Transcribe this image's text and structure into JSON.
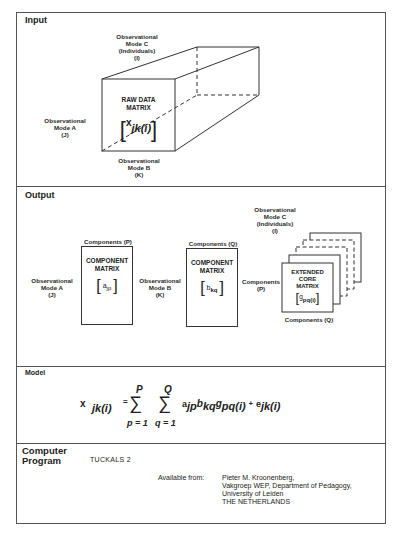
{
  "sections": {
    "input": {
      "title": "Input",
      "mode_c": [
        "Observational",
        "Mode C",
        "(Individuals)",
        "(I)"
      ],
      "mode_a": [
        "Observational",
        "Mode A",
        "(J)"
      ],
      "mode_b": [
        "Observational",
        "Mode B",
        "(K)"
      ],
      "box_title": [
        "RAW DATA",
        "MATRIX"
      ],
      "matrix_symbol": "x",
      "matrix_subscript": "jk(i)"
    },
    "output": {
      "title": "Output",
      "mode_a": [
        "Observational",
        "Mode A",
        "(J)"
      ],
      "mode_b": [
        "Observational",
        "Mode B",
        "(K)"
      ],
      "mode_c": [
        "Observational",
        "Mode C",
        "(Individuals)",
        "(I)"
      ],
      "comp_a": {
        "top_label": "Components (P)",
        "title": [
          "COMPONENT",
          "MATRIX"
        ],
        "symbol": "a",
        "subscript": "jp"
      },
      "comp_b": {
        "top_label": "Components (Q)",
        "title": [
          "COMPONENT",
          "MATRIX"
        ],
        "symbol": "b",
        "subscript": "kq"
      },
      "core": {
        "left_label": [
          "Components",
          "(P)"
        ],
        "bottom_label": "Components (Q)",
        "title": [
          "EXTENDED",
          "CORE",
          "MATRIX"
        ],
        "symbol": "g",
        "subscript": "pq(i)"
      }
    },
    "model": {
      "title": "Model",
      "lhs": "x",
      "lhs_sub": "jk(i)",
      "equals": "=",
      "sum1_top": "P",
      "sum1_bottom": "p = 1",
      "sum2_top": "Q",
      "sum2_bottom": "q = 1",
      "sigma": "∑",
      "term_a": "a",
      "term_a_sub": "jp",
      "term_b": "b",
      "term_b_sub": "kq",
      "term_g": "g",
      "term_g_sub": "pq(i)",
      "plus": "+",
      "term_e": "e",
      "term_e_sub": "jk(i)"
    },
    "program": {
      "title_line1": "Computer",
      "title_line2": "Program",
      "name": "TUCKALS 2",
      "available_label": "Available from:",
      "address": [
        "Pieter M. Kroonenberg,",
        "Vakgroep WEP, Department of Pedagogy,",
        "University of Leiden",
        "THE NETHERLANDS"
      ]
    }
  }
}
